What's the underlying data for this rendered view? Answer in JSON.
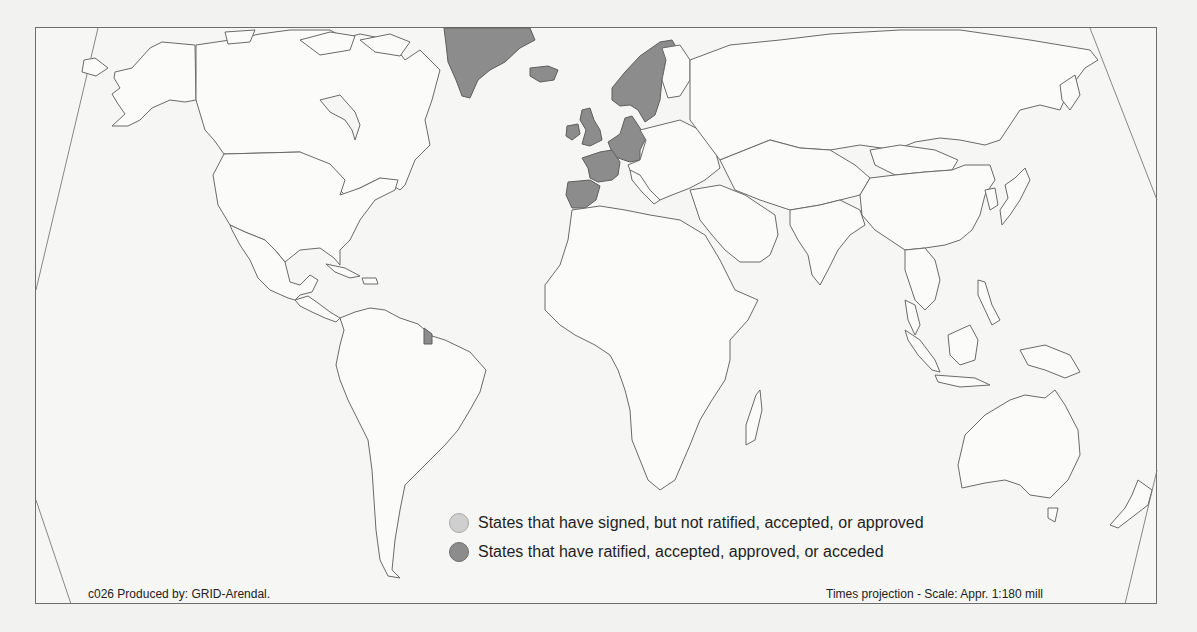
{
  "map": {
    "projection": "Times projection",
    "frame_color": "#6e6e6e",
    "land_fill": "#fbfbfa",
    "border_color": "#6a6a6a",
    "ratified_color": "#8c8c8c",
    "signed_color": "#cfcfcf",
    "ratified_regions": [
      "Greenland",
      "Iceland",
      "Norway",
      "Sweden",
      "Denmark",
      "United Kingdom",
      "Ireland",
      "Netherlands",
      "Belgium",
      "Luxembourg",
      "Germany",
      "France",
      "Spain",
      "Portugal",
      "French Guiana"
    ]
  },
  "legend": {
    "items": [
      {
        "label": "States that have signed, but not ratified, accepted, or approved",
        "color": "#cfcfcf"
      },
      {
        "label": "States that have ratified, accepted, approved, or acceded",
        "color": "#8c8c8c"
      }
    ]
  },
  "footer": {
    "credit": "c026 Produced by: GRID-Arendal.",
    "scale": "Times projection - Scale: Appr. 1:180 mill"
  }
}
